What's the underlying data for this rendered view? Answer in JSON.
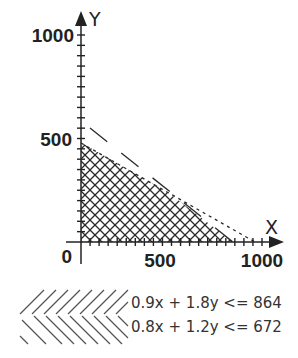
{
  "chart_data": {
    "type": "area",
    "title": "",
    "xlabel": "X",
    "ylabel": "Y",
    "xlim": [
      0,
      1000
    ],
    "ylim": [
      0,
      1000
    ],
    "x_tick_labels": [
      "0",
      "500",
      "1000"
    ],
    "y_tick_labels": [
      "500",
      "1000"
    ],
    "minor_tick_step": 50,
    "grid": false,
    "constraints": [
      {
        "label": "0.9x + 1.8y <= 864",
        "a": 0.9,
        "b": 1.8,
        "c": 864,
        "x_intercept": 960,
        "y_intercept": 480,
        "hatch": "forward-slash"
      },
      {
        "label": "0.8x + 1.2y <= 672",
        "a": 0.8,
        "b": 1.2,
        "c": 672,
        "x_intercept": 840,
        "y_intercept": 560,
        "hatch": "back-slash"
      }
    ],
    "feasible_region_vertices": [
      [
        0,
        0
      ],
      [
        0,
        480
      ],
      [
        480,
        240
      ],
      [
        840,
        0
      ]
    ],
    "legend_position": "bottom"
  },
  "axes": {
    "x_name": "X",
    "y_name": "Y",
    "origin_label": "0",
    "x_ticks": [
      "500",
      "1000"
    ],
    "y_ticks": [
      "500",
      "1000"
    ]
  },
  "legend": [
    {
      "label": "0.9x + 1.8y <= 864"
    },
    {
      "label": "0.8x + 1.2y <= 672"
    }
  ],
  "colors": {
    "ink": "#222222",
    "hatch": "#2a2a2a",
    "legend_hatch": "#555555"
  }
}
